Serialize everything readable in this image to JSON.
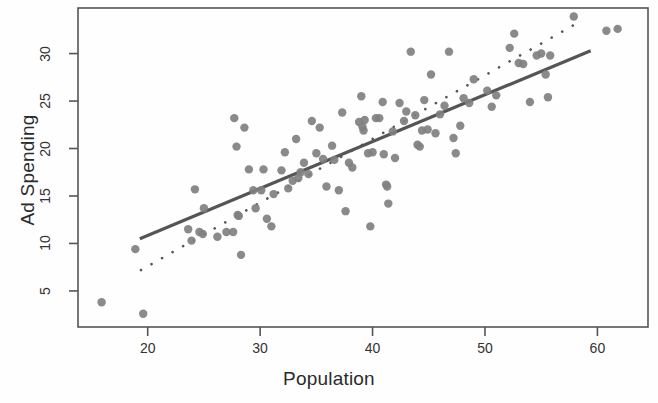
{
  "chart_data": {
    "type": "scatter",
    "title": "",
    "xlabel": "Population",
    "ylabel": "Ad Spending",
    "xlim": [
      13.8,
      64.5
    ],
    "ylim": [
      1.2,
      34.8
    ],
    "xticks": [
      20,
      30,
      40,
      50,
      60
    ],
    "yticks": [
      5,
      10,
      15,
      20,
      25,
      30
    ],
    "grid": false,
    "legend": null,
    "point_color": "#808080",
    "line_color": "#555555",
    "frame_color": "#555555",
    "series": [
      {
        "name": "observations",
        "marker": "filled-circle",
        "color": "#808080",
        "points": [
          [
            15.9,
            3.8
          ],
          [
            19.6,
            2.6
          ],
          [
            18.9,
            9.4
          ],
          [
            23.6,
            11.5
          ],
          [
            23.9,
            10.3
          ],
          [
            24.2,
            15.7
          ],
          [
            24.6,
            11.2
          ],
          [
            24.9,
            11.0
          ],
          [
            25.0,
            13.7
          ],
          [
            26.2,
            10.7
          ],
          [
            27.0,
            11.2
          ],
          [
            27.6,
            11.2
          ],
          [
            27.7,
            23.2
          ],
          [
            27.9,
            20.2
          ],
          [
            28.0,
            13.0
          ],
          [
            28.1,
            12.9
          ],
          [
            28.3,
            8.8
          ],
          [
            28.6,
            22.2
          ],
          [
            29.0,
            17.8
          ],
          [
            29.4,
            15.6
          ],
          [
            29.6,
            13.7
          ],
          [
            30.1,
            15.6
          ],
          [
            30.3,
            17.8
          ],
          [
            30.6,
            12.6
          ],
          [
            31.0,
            11.8
          ],
          [
            31.2,
            15.2
          ],
          [
            31.9,
            17.7
          ],
          [
            32.2,
            19.6
          ],
          [
            32.5,
            15.8
          ],
          [
            32.9,
            16.6
          ],
          [
            33.2,
            21.0
          ],
          [
            33.4,
            16.9
          ],
          [
            33.6,
            17.5
          ],
          [
            33.9,
            18.5
          ],
          [
            34.3,
            17.3
          ],
          [
            34.6,
            22.9
          ],
          [
            35.0,
            19.5
          ],
          [
            35.3,
            22.2
          ],
          [
            35.6,
            18.9
          ],
          [
            35.9,
            16.0
          ],
          [
            36.4,
            20.3
          ],
          [
            36.6,
            18.8
          ],
          [
            37.0,
            15.6
          ],
          [
            37.3,
            23.8
          ],
          [
            37.6,
            13.4
          ],
          [
            37.9,
            18.5
          ],
          [
            38.2,
            18.0
          ],
          [
            38.8,
            22.8
          ],
          [
            39.0,
            25.5
          ],
          [
            39.1,
            22.3
          ],
          [
            39.2,
            21.9
          ],
          [
            39.3,
            23.0
          ],
          [
            39.6,
            19.5
          ],
          [
            39.8,
            11.8
          ],
          [
            40.0,
            19.6
          ],
          [
            40.3,
            23.2
          ],
          [
            40.6,
            23.2
          ],
          [
            40.9,
            24.9
          ],
          [
            41.0,
            19.4
          ],
          [
            41.2,
            16.2
          ],
          [
            41.3,
            16.0
          ],
          [
            41.4,
            14.2
          ],
          [
            41.8,
            21.8
          ],
          [
            42.0,
            19.0
          ],
          [
            42.4,
            24.8
          ],
          [
            42.8,
            22.9
          ],
          [
            43.0,
            23.9
          ],
          [
            43.4,
            30.2
          ],
          [
            43.8,
            23.5
          ],
          [
            44.0,
            20.4
          ],
          [
            44.2,
            20.2
          ],
          [
            44.4,
            21.9
          ],
          [
            44.6,
            25.1
          ],
          [
            44.9,
            22.0
          ],
          [
            45.2,
            27.8
          ],
          [
            45.6,
            21.6
          ],
          [
            46.0,
            23.6
          ],
          [
            46.4,
            24.5
          ],
          [
            46.8,
            30.2
          ],
          [
            47.2,
            21.1
          ],
          [
            47.4,
            19.5
          ],
          [
            47.8,
            22.4
          ],
          [
            48.1,
            25.3
          ],
          [
            48.6,
            24.8
          ],
          [
            49.0,
            27.3
          ],
          [
            50.2,
            26.1
          ],
          [
            50.6,
            24.4
          ],
          [
            51.0,
            25.6
          ],
          [
            52.2,
            30.6
          ],
          [
            52.6,
            32.1
          ],
          [
            53.0,
            29.0
          ],
          [
            53.4,
            28.9
          ],
          [
            54.0,
            24.9
          ],
          [
            54.6,
            29.8
          ],
          [
            55.0,
            30.0
          ],
          [
            55.4,
            27.8
          ],
          [
            55.6,
            25.4
          ],
          [
            55.8,
            29.8
          ],
          [
            57.9,
            33.9
          ],
          [
            60.8,
            32.4
          ],
          [
            61.8,
            32.6
          ]
        ]
      },
      {
        "name": "solid-regression-line",
        "type": "line",
        "style": "solid",
        "color": "#555555",
        "width": 3.2,
        "endpoints": [
          [
            19.3,
            10.5
          ],
          [
            59.4,
            30.3
          ]
        ]
      },
      {
        "name": "dotted-regression-line",
        "type": "line",
        "style": "dotted",
        "color": "#555555",
        "width": 2.6,
        "endpoints": [
          [
            19.4,
            7.2
          ],
          [
            58.2,
            33.2
          ]
        ]
      }
    ]
  }
}
